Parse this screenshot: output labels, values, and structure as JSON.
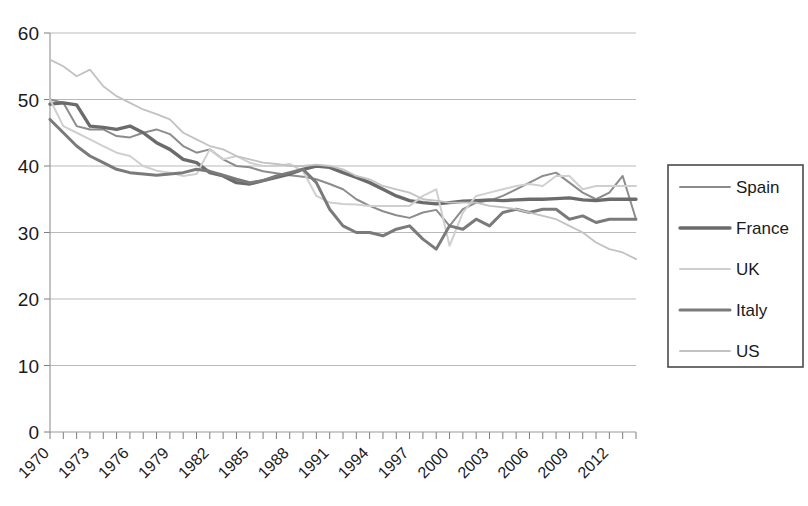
{
  "chart_data": {
    "type": "line",
    "title": "",
    "xlabel": "",
    "ylabel": "",
    "xlim": [
      1970,
      2014
    ],
    "ylim": [
      0,
      60
    ],
    "ytick_step": 10,
    "yticks": [
      0,
      10,
      20,
      30,
      40,
      50,
      60
    ],
    "xticks": [
      1970,
      1973,
      1976,
      1979,
      1982,
      1985,
      1988,
      1991,
      1994,
      1997,
      2000,
      2003,
      2006,
      2009,
      2012
    ],
    "xtick_rotation": -45,
    "grid": true,
    "grid_axis": "y",
    "legend_position": "right",
    "x": [
      1970,
      1971,
      1972,
      1973,
      1974,
      1975,
      1976,
      1977,
      1978,
      1979,
      1980,
      1981,
      1982,
      1983,
      1984,
      1985,
      1986,
      1987,
      1988,
      1989,
      1990,
      1991,
      1992,
      1993,
      1994,
      1995,
      1996,
      1997,
      1998,
      1999,
      2000,
      2001,
      2002,
      2003,
      2004,
      2005,
      2006,
      2007,
      2008,
      2009,
      2010,
      2011,
      2012,
      2013,
      2014
    ],
    "series": [
      {
        "name": "Spain",
        "color": "#8c8c8c",
        "width": 2.0,
        "values": [
          50.0,
          49.5,
          46.0,
          45.5,
          45.5,
          44.5,
          44.3,
          45.0,
          45.5,
          44.8,
          43.0,
          42.0,
          42.5,
          41.0,
          40.0,
          39.8,
          39.2,
          38.9,
          38.6,
          38.4,
          38.0,
          37.3,
          36.5,
          35.0,
          34.0,
          33.2,
          32.6,
          32.2,
          33.0,
          33.4,
          31.0,
          33.5,
          34.5,
          34.8,
          35.5,
          36.5,
          37.5,
          38.5,
          39.0,
          37.5,
          36.0,
          35.0,
          36.0,
          38.5,
          32.0
        ]
      },
      {
        "name": "France",
        "color": "#6b6b6b",
        "width": 3.4,
        "values": [
          49.3,
          49.5,
          49.2,
          46.0,
          45.8,
          45.5,
          46.0,
          45.0,
          43.5,
          42.5,
          41.0,
          40.5,
          39.0,
          38.5,
          37.5,
          37.3,
          37.8,
          38.3,
          38.8,
          39.5,
          40.0,
          39.8,
          39.0,
          38.3,
          37.5,
          36.5,
          35.5,
          34.8,
          34.5,
          34.3,
          34.5,
          34.7,
          34.8,
          34.9,
          34.8,
          34.9,
          35.0,
          35.0,
          35.1,
          35.2,
          34.9,
          34.8,
          35.0,
          35.0,
          35.0
        ]
      },
      {
        "name": "UK",
        "color": "#cfcfcf",
        "width": 2.0,
        "values": [
          50.0,
          46.0,
          45.0,
          44.0,
          43.0,
          42.0,
          41.5,
          40.0,
          39.3,
          39.0,
          38.5,
          38.8,
          42.5,
          41.0,
          41.5,
          40.5,
          40.0,
          40.0,
          40.3,
          39.2,
          35.5,
          34.5,
          34.3,
          34.2,
          34.0,
          34.0,
          34.0,
          34.0,
          35.5,
          36.5,
          28.0,
          33.0,
          35.5,
          36.0,
          36.5,
          37.0,
          37.3,
          37.0,
          38.5,
          38.5,
          36.5,
          37.0,
          37.0,
          37.0,
          37.0
        ]
      },
      {
        "name": "Italy",
        "color": "#7a7a7a",
        "width": 3.0,
        "values": [
          47.0,
          45.0,
          43.0,
          41.5,
          40.5,
          39.5,
          39.0,
          38.8,
          38.6,
          38.8,
          39.0,
          39.5,
          39.2,
          38.6,
          38.0,
          37.5,
          37.8,
          38.5,
          39.0,
          39.5,
          37.5,
          33.5,
          31.0,
          30.0,
          30.0,
          29.5,
          30.5,
          31.0,
          29.0,
          27.5,
          31.0,
          30.5,
          32.0,
          31.0,
          33.0,
          33.5,
          33.0,
          33.5,
          33.5,
          32.0,
          32.5,
          31.5,
          32.0,
          32.0,
          32.0
        ]
      },
      {
        "name": "US",
        "color": "#c2c2c2",
        "width": 1.8,
        "values": [
          56.0,
          55.0,
          53.5,
          54.5,
          52.0,
          50.5,
          49.5,
          48.5,
          47.8,
          47.0,
          45.0,
          44.0,
          43.0,
          42.5,
          41.5,
          41.0,
          40.5,
          40.3,
          40.0,
          40.0,
          40.2,
          40.0,
          39.5,
          38.5,
          38.0,
          37.0,
          36.5,
          36.0,
          35.0,
          34.8,
          34.5,
          34.5,
          34.5,
          34.0,
          33.8,
          33.5,
          33.0,
          32.5,
          32.0,
          31.0,
          30.0,
          28.5,
          27.5,
          27.0,
          26.0
        ]
      }
    ]
  },
  "legend": {
    "entries": [
      {
        "label": "Spain"
      },
      {
        "label": "France"
      },
      {
        "label": "UK"
      },
      {
        "label": "Italy"
      },
      {
        "label": "US"
      }
    ]
  }
}
